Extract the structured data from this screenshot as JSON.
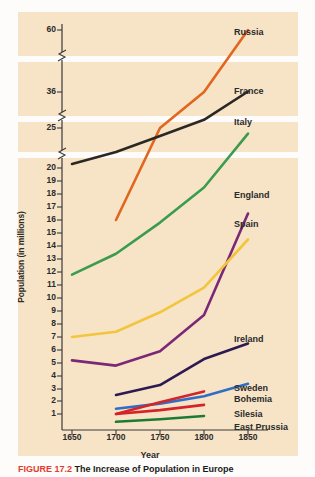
{
  "figure": {
    "caption_number": "FIGURE 17.2",
    "caption_text": "The Increase of Population in Europe",
    "background_color": "#f7e4c6",
    "page_color": "#fdfcfa"
  },
  "axes": {
    "y_title": "Population (in millions)",
    "x_title": "Year",
    "y_ticks": [
      "60",
      "36",
      "25",
      "20",
      "19",
      "18",
      "17",
      "16",
      "15",
      "14",
      "13",
      "12",
      "11",
      "10",
      "9",
      "8",
      "7",
      "6",
      "5",
      "4",
      "3",
      "2",
      "1"
    ],
    "x_ticks": [
      "1650",
      "1700",
      "1750",
      "1800",
      "1850"
    ],
    "y_breaks": 3,
    "break_marker": "axis-break-zigzag"
  },
  "chart_data": {
    "type": "line",
    "title": "The Increase of Population in Europe",
    "xlabel": "Year",
    "ylabel": "Population (in millions)",
    "x": [
      1650,
      1700,
      1750,
      1800,
      1850
    ],
    "xlim": [
      1650,
      1850
    ],
    "ylim": [
      0,
      60
    ],
    "grid": false,
    "legend_position": "right-inline",
    "y_axis_note": "Broken (non-linear) axis: ticks 1-20 evenly spaced, then breaks before 25, 36 and 60",
    "series": [
      {
        "name": "Russia",
        "color": "#e1661f",
        "x": [
          1700,
          1750,
          1800,
          1850
        ],
        "values": [
          16.0,
          25.0,
          36.0,
          60.0
        ],
        "label_y": 27
      },
      {
        "name": "France",
        "color": "#2b2823",
        "x": [
          1650,
          1700,
          1750,
          1800,
          1850
        ],
        "values": [
          20.5,
          22.0,
          24.0,
          27.5,
          36.2
        ],
        "label_y": 86
      },
      {
        "name": "Italy",
        "color": "#3b9b4e",
        "x": [
          1650,
          1700,
          1750,
          1800,
          1850
        ],
        "values": [
          11.8,
          13.4,
          15.8,
          18.5,
          24.3
        ],
        "label_y": 117
      },
      {
        "name": "England",
        "color": "#7b2878",
        "x": [
          1650,
          1700,
          1750,
          1800,
          1850
        ],
        "values": [
          5.2,
          4.8,
          5.9,
          8.7,
          16.5
        ],
        "label_y": 190
      },
      {
        "name": "Spain",
        "color": "#f2c53d",
        "x": [
          1650,
          1700,
          1750,
          1800,
          1850
        ],
        "values": [
          7.0,
          7.4,
          8.9,
          10.8,
          14.5
        ],
        "label_y": 219
      },
      {
        "name": "Ireland",
        "color": "#2e1a52",
        "x": [
          1700,
          1750,
          1800,
          1850
        ],
        "values": [
          2.5,
          3.3,
          5.3,
          6.5
        ],
        "label_y": 334
      },
      {
        "name": "Sweden",
        "color": "#2f6ec4",
        "x": [
          1700,
          1750,
          1800,
          1850
        ],
        "values": [
          1.4,
          1.8,
          2.4,
          3.4
        ],
        "label_y": 383
      },
      {
        "name": "Bohemia",
        "color": "#d5232a",
        "x": [
          1700,
          1750,
          1800
        ],
        "values": [
          1.0,
          1.9,
          2.8
        ],
        "label_y": 394
      },
      {
        "name": "Silesia",
        "color": "#d5232a",
        "x": [
          1700,
          1750,
          1800
        ],
        "values": [
          1.0,
          1.3,
          1.7
        ],
        "label_y": 409
      },
      {
        "name": "East Prussia",
        "color": "#1c7a34",
        "x": [
          1700,
          1750,
          1800
        ],
        "values": [
          0.4,
          0.6,
          0.85
        ],
        "label_y": 422
      }
    ]
  }
}
